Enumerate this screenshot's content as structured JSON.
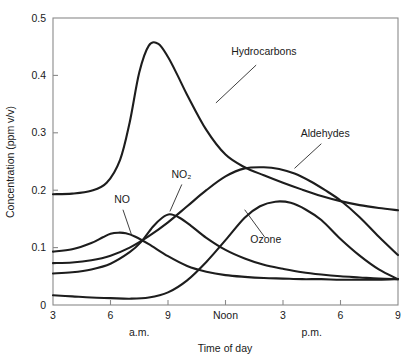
{
  "chart_data": {
    "type": "line",
    "title": "",
    "xlabel": "Time of day",
    "ylabel": "Concentration (ppm v/v)",
    "xlim": [
      3,
      21
    ],
    "ylim": [
      0,
      0.5
    ],
    "grid": false,
    "legend_position": "inline-annotations",
    "x_tick_values": [
      3,
      6,
      9,
      12,
      15,
      18,
      21
    ],
    "x_tick_labels": [
      "3",
      "6",
      "9",
      "Noon",
      "3",
      "6",
      "9"
    ],
    "y_tick_values": [
      0,
      0.1,
      0.2,
      0.3,
      0.4,
      0.5
    ],
    "y_tick_labels": [
      "0",
      "0.1",
      "0.2",
      "0.3",
      "0.4",
      "0.5"
    ],
    "period_labels": [
      {
        "text": "a.m.",
        "x": 7.5
      },
      {
        "text": "p.m.",
        "x": 16.5
      }
    ],
    "series": [
      {
        "name": "Hydrocarbons",
        "label_x": 14.0,
        "label_y": 0.435,
        "leader_from": [
          13.6,
          0.418
        ],
        "leader_to": [
          11.5,
          0.352
        ],
        "x": [
          3,
          4,
          5,
          5.8,
          6.5,
          7,
          7.5,
          8,
          8.5,
          9,
          9.5,
          10,
          11,
          12,
          13,
          14,
          15,
          16,
          17,
          18,
          19,
          20,
          21
        ],
        "values": [
          0.193,
          0.194,
          0.199,
          0.213,
          0.253,
          0.318,
          0.405,
          0.452,
          0.455,
          0.432,
          0.4,
          0.366,
          0.305,
          0.262,
          0.24,
          0.226,
          0.213,
          0.201,
          0.19,
          0.181,
          0.174,
          0.169,
          0.165
        ]
      },
      {
        "name": "NO",
        "label_x": 6.6,
        "label_y": 0.178,
        "leader_from": [
          6.65,
          0.166
        ],
        "leader_to": [
          7.1,
          0.122
        ],
        "x": [
          3,
          4,
          5,
          5.6,
          6,
          6.4,
          6.8,
          7.3,
          8,
          9,
          10,
          11,
          12,
          13,
          14,
          15,
          16,
          17,
          18,
          19,
          20,
          21
        ],
        "values": [
          0.093,
          0.097,
          0.108,
          0.118,
          0.124,
          0.126,
          0.125,
          0.119,
          0.106,
          0.085,
          0.068,
          0.058,
          0.052,
          0.049,
          0.047,
          0.046,
          0.045,
          0.045,
          0.044,
          0.044,
          0.044,
          0.045
        ]
      },
      {
        "name": "NO2",
        "display_name": "NO₂",
        "label_x": 9.7,
        "label_y": 0.222,
        "leader_from": [
          9.72,
          0.21
        ],
        "leader_to": [
          9.1,
          0.163
        ],
        "x": [
          3,
          4,
          5,
          6,
          7,
          7.6,
          8.2,
          8.7,
          9.1,
          9.6,
          10.2,
          11,
          12,
          13,
          14,
          15,
          16,
          17,
          18,
          19,
          20,
          21
        ],
        "values": [
          0.055,
          0.057,
          0.062,
          0.072,
          0.092,
          0.11,
          0.136,
          0.152,
          0.158,
          0.152,
          0.138,
          0.117,
          0.096,
          0.081,
          0.07,
          0.063,
          0.057,
          0.053,
          0.05,
          0.048,
          0.046,
          0.045
        ]
      },
      {
        "name": "Ozone",
        "label_x": 14.1,
        "label_y": 0.108,
        "leader_from": [
          14.05,
          0.118
        ],
        "leader_to": [
          13.0,
          0.166
        ],
        "x": [
          3,
          4,
          5,
          6,
          7,
          8,
          9,
          10,
          11,
          12,
          13,
          13.8,
          14.6,
          15.4,
          16.2,
          17,
          18,
          19,
          20,
          21
        ],
        "values": [
          0.017,
          0.015,
          0.013,
          0.012,
          0.011,
          0.013,
          0.022,
          0.043,
          0.075,
          0.113,
          0.152,
          0.172,
          0.18,
          0.178,
          0.166,
          0.148,
          0.115,
          0.086,
          0.062,
          0.045
        ]
      },
      {
        "name": "Aldehydes",
        "label_x": 17.2,
        "label_y": 0.293,
        "leader_from": [
          17.0,
          0.281
        ],
        "leader_to": [
          15.6,
          0.238
        ],
        "x": [
          3,
          4,
          5,
          6,
          7,
          8,
          9,
          10,
          11,
          12,
          13,
          14,
          14.8,
          15.6,
          16.4,
          17.2,
          18,
          19,
          20,
          21
        ],
        "values": [
          0.073,
          0.074,
          0.078,
          0.086,
          0.1,
          0.12,
          0.144,
          0.172,
          0.2,
          0.224,
          0.238,
          0.24,
          0.237,
          0.229,
          0.216,
          0.2,
          0.182,
          0.153,
          0.119,
          0.087
        ]
      }
    ]
  }
}
